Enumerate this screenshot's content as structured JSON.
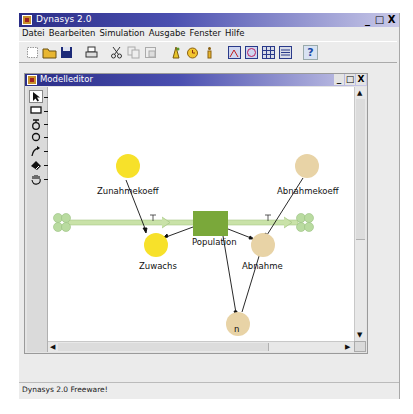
{
  "app": {
    "title": "Dynasys 2.0",
    "window_controls": [
      "_",
      "□",
      "X"
    ],
    "menu": [
      "Datei",
      "Bearbeiten",
      "Simulation",
      "Ausgabe",
      "Fenster",
      "Hilfe"
    ],
    "toolbar": [
      {
        "name": "new-icon",
        "glyph": "⬚"
      },
      {
        "name": "open-folder-icon",
        "glyph": "📂"
      },
      {
        "name": "save-disk-icon",
        "glyph": "■"
      },
      {
        "sep": true
      },
      {
        "name": "print-icon",
        "glyph": "⎙"
      },
      {
        "sep": true
      },
      {
        "name": "cut-icon",
        "glyph": "✂"
      },
      {
        "name": "copy-icon",
        "glyph": "❐"
      },
      {
        "name": "paste-icon",
        "glyph": "❏"
      },
      {
        "sep": true
      },
      {
        "name": "run-simulation-icon",
        "glyph": "♗"
      },
      {
        "name": "clock-icon",
        "glyph": "◷"
      },
      {
        "name": "info-icon",
        "glyph": "ℹ"
      },
      {
        "sep": true
      },
      {
        "name": "time-graph-icon",
        "glyph": "◩"
      },
      {
        "name": "phase-graph-icon",
        "glyph": "◪"
      },
      {
        "name": "table-icon",
        "glyph": "▦"
      },
      {
        "name": "list-icon",
        "glyph": "▤"
      },
      {
        "sep": true
      },
      {
        "name": "help-icon",
        "glyph": "?"
      }
    ],
    "status": "Dynasys 2.0 Freeware!"
  },
  "editor": {
    "title": "Modelleditor",
    "window_controls": [
      "_",
      "□",
      "X"
    ],
    "palette": [
      {
        "name": "select-arrow-tool",
        "glyph": "➤",
        "callout": "1"
      },
      {
        "name": "stock-rectangle-tool",
        "glyph": "▭",
        "callout": "2"
      },
      {
        "name": "flow-valve-tool",
        "glyph": "ठ",
        "callout": "3"
      },
      {
        "name": "converter-circle-tool",
        "glyph": "○",
        "callout": "4"
      },
      {
        "name": "connector-arrow-tool",
        "glyph": "↗",
        "callout": "5"
      },
      {
        "name": "eraser-tool",
        "glyph": "◆",
        "callout": "6"
      },
      {
        "name": "hand-pan-tool",
        "glyph": "✋",
        "callout": "7"
      }
    ],
    "model": {
      "stocks": [
        {
          "label": "Population",
          "color": "#7aa83a"
        }
      ],
      "flows": [
        {
          "label": "Zuwachs",
          "color": "#f7e12a"
        },
        {
          "label": "Abnahme",
          "color": "#e8d3a6"
        }
      ],
      "converters": [
        {
          "label": "Zunahmekoeff",
          "color": "#f7e12a"
        },
        {
          "label": "Abnahmekoeff",
          "color": "#e8d3a6"
        },
        {
          "label": "n",
          "color": "#e8d3a6"
        }
      ],
      "pipe_color": "#c9e2a8",
      "cloud_color": "#b9dba0"
    }
  }
}
